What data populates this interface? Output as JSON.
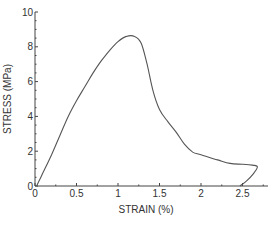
{
  "chart_data": {
    "type": "line",
    "title": "",
    "xlabel": "STRAIN (%)",
    "ylabel": "STRESS (MPa)",
    "xlim": [
      0,
      2.8
    ],
    "ylim": [
      0,
      10
    ],
    "grid": false,
    "legend": null,
    "x_ticks": [
      0,
      0.5,
      1,
      1.5,
      2,
      2.5
    ],
    "x_tick_labels": [
      "0",
      "0.5",
      "1",
      "1.5",
      "2",
      "2.5"
    ],
    "y_ticks": [
      0,
      2,
      4,
      6,
      8,
      10
    ],
    "y_tick_labels": [
      "0",
      "2",
      "4",
      "6",
      "8",
      "10"
    ],
    "series": [
      {
        "name": "stress-strain",
        "color": "#555555",
        "x": [
          0.02,
          0.05,
          0.1,
          0.2,
          0.3,
          0.4,
          0.5,
          0.6,
          0.7,
          0.8,
          0.9,
          1.0,
          1.1,
          1.2,
          1.28,
          1.35,
          1.42,
          1.5,
          1.6,
          1.7,
          1.8,
          1.9,
          2.0,
          2.2,
          2.35,
          2.5,
          2.62,
          2.68,
          2.63,
          2.55,
          2.47
        ],
        "y": [
          0.0,
          0.3,
          0.8,
          1.8,
          2.9,
          4.0,
          4.9,
          5.7,
          6.5,
          7.2,
          7.8,
          8.3,
          8.6,
          8.6,
          8.2,
          7.0,
          5.5,
          4.4,
          3.7,
          3.1,
          2.4,
          1.95,
          1.8,
          1.5,
          1.3,
          1.25,
          1.2,
          1.1,
          0.7,
          0.3,
          0.0
        ]
      }
    ]
  }
}
